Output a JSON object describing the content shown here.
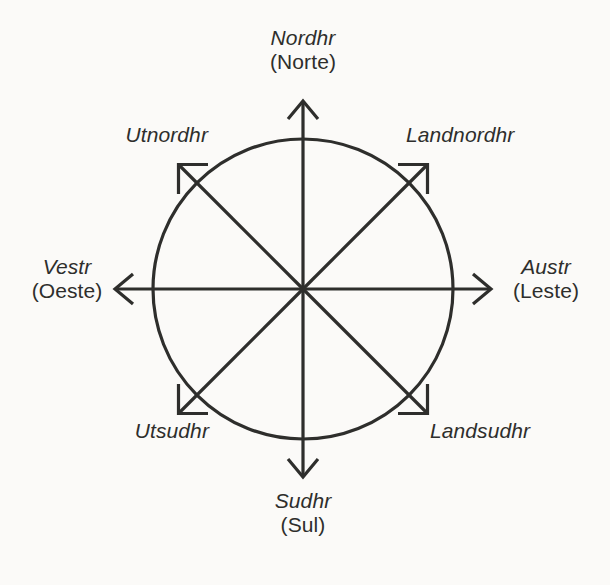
{
  "figure": {
    "name": "old-norse-compass-rose",
    "background_color": "#fbfaf8",
    "ink_color": "#2e2e2c"
  },
  "geometry": {
    "center_x": 303,
    "center_y": 289,
    "circle_radius": 150,
    "cardinal_arrow_radius": 193,
    "intercardinal_arrow_radius": 176,
    "stroke_width": 3.2
  },
  "directions": [
    {
      "key": "north",
      "native": "Nordhr",
      "gloss": "(Norte)",
      "angle_deg": 90,
      "type": "cardinal"
    },
    {
      "key": "northeast",
      "native": "Landnordhr",
      "gloss": "",
      "angle_deg": 45,
      "type": "intercardinal"
    },
    {
      "key": "east",
      "native": "Austr",
      "gloss": "(Leste)",
      "angle_deg": 0,
      "type": "cardinal"
    },
    {
      "key": "southeast",
      "native": "Landsudhr",
      "gloss": "",
      "angle_deg": -45,
      "type": "intercardinal"
    },
    {
      "key": "south",
      "native": "Sudhr",
      "gloss": "(Sul)",
      "angle_deg": -90,
      "type": "cardinal"
    },
    {
      "key": "southwest",
      "native": "Utsudhr",
      "gloss": "",
      "angle_deg": -135,
      "type": "intercardinal"
    },
    {
      "key": "west",
      "native": "Vestr",
      "gloss": "(Oeste)",
      "angle_deg": 180,
      "type": "cardinal"
    },
    {
      "key": "northwest",
      "native": "Utnordhr",
      "gloss": "",
      "angle_deg": 135,
      "type": "intercardinal"
    }
  ]
}
